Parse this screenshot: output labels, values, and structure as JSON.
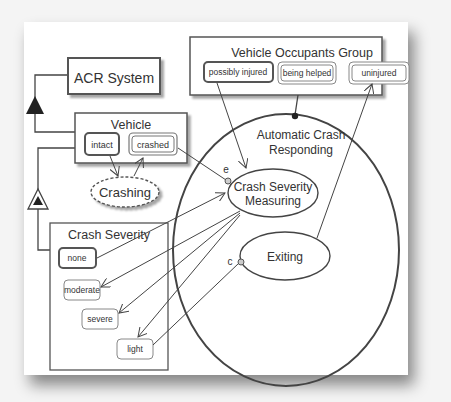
{
  "diagram": {
    "objects": {
      "acr_system": "ACR System",
      "vehicle": "Vehicle",
      "crash_severity": "Crash Severity",
      "vehicle_occupants_group": "Vehicle Occupants Group"
    },
    "states": {
      "intact": "intact",
      "crashed": "crashed",
      "none": "none",
      "moderate": "moderate",
      "severe": "severe",
      "light": "light",
      "possibly_injured": "possibly injured",
      "being_helped": "being helped",
      "uninjured": "uninjured"
    },
    "processes": {
      "crashing": "Crashing",
      "automatic_crash_responding_line1": "Automatic Crash",
      "automatic_crash_responding_line2": "Responding",
      "crash_severity_measuring_line1": "Crash Severity",
      "crash_severity_measuring_line2": "Measuring",
      "exiting": "Exiting"
    },
    "link_labels": {
      "event": "e",
      "condition": "c"
    }
  }
}
